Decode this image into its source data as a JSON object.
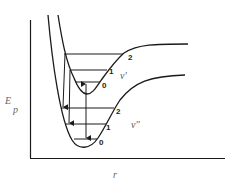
{
  "diagram": {
    "type": "potential-energy-curves",
    "colors": {
      "line": "#1a1a1a",
      "label": "#555555",
      "background": "#ffffff"
    },
    "axes": {
      "y_label_main": "E",
      "y_label_sub": "p",
      "x_label": "r"
    },
    "upper_state": {
      "label": "v'",
      "levels": [
        "0",
        "1",
        "2"
      ]
    },
    "lower_state": {
      "label": "v''",
      "levels": [
        "0",
        "1",
        "2"
      ]
    },
    "transitions": [
      {
        "from": "upper 2",
        "to": "lower 2",
        "type": "down-arrow"
      },
      {
        "from": "upper 1",
        "to": "lower 1",
        "type": "down-arrow"
      },
      {
        "from": "upper 0",
        "to": "lower 0",
        "type": "double-arrow"
      }
    ]
  }
}
